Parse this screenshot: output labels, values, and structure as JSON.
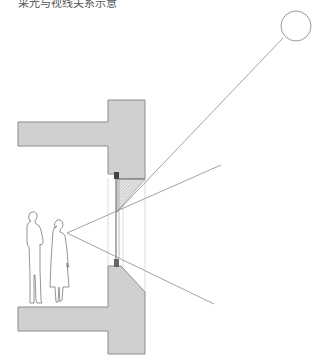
{
  "caption": "采光与视线关系示意",
  "diagram": {
    "type": "architectural-section",
    "elements": {
      "sun": {
        "cx": 296,
        "cy": 26,
        "r": 15
      },
      "upper_wall": {
        "slab": [
          18,
          122,
          90,
          24
        ],
        "block": [
          108,
          100,
          37,
          79
        ]
      },
      "lower_wall": {
        "slab": [
          18,
          307,
          90,
          24
        ]
      },
      "window": {
        "x": 115,
        "y_top": 176,
        "y_bottom": 266
      },
      "eye_point": [
        67,
        233
      ],
      "colors": {
        "fill": "#d0d0d0",
        "stroke": "#888888",
        "line": "#8a8a8a"
      }
    }
  }
}
